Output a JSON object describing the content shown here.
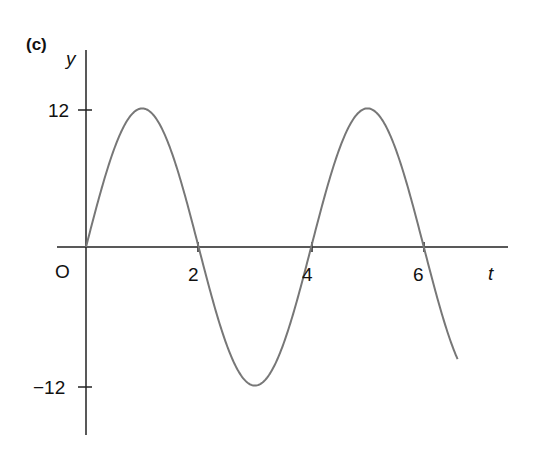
{
  "panel_label": "(c)",
  "axes": {
    "x_label": "t",
    "y_label": "y",
    "origin_label": "O",
    "x_ticks": [
      {
        "value": 2,
        "label": "2"
      },
      {
        "value": 4,
        "label": "4"
      },
      {
        "value": 6,
        "label": "6"
      }
    ],
    "y_ticks": [
      {
        "value": 12,
        "label": "12"
      },
      {
        "value": -12,
        "label": "−12"
      }
    ]
  },
  "colors": {
    "axis": "#222222",
    "curve": "#777777",
    "text": "#111111"
  },
  "chart_data": {
    "type": "line",
    "title": "(c)",
    "xlabel": "t",
    "ylabel": "y",
    "xlim": [
      0,
      6.6
    ],
    "ylim": [
      -12,
      12
    ],
    "grid": false,
    "legend": null,
    "function": "y = 12 sin(pi t / 2)",
    "series": [
      {
        "name": "y",
        "x": [
          0,
          0.5,
          1,
          1.5,
          2,
          2.5,
          3,
          3.5,
          4,
          4.5,
          5,
          5.5,
          6,
          6.6
        ],
        "values": [
          0,
          8.49,
          12,
          8.49,
          0,
          -8.49,
          -12,
          -8.49,
          0,
          8.49,
          12,
          8.49,
          0,
          -9.7
        ]
      }
    ],
    "x_ticks": [
      2,
      4,
      6
    ],
    "y_ticks": [
      12,
      -12
    ]
  }
}
